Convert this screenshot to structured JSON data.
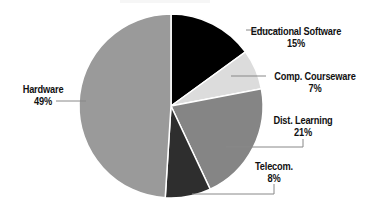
{
  "chart_data": {
    "type": "pie",
    "title": "",
    "start_angle_deg": 0,
    "direction": "clockwise",
    "center": [
      171,
      106
    ],
    "radius": 92,
    "slices": [
      {
        "label": "Educational Software",
        "value": 15,
        "display": "15%",
        "color": "#000000"
      },
      {
        "label": "Comp. Courseware",
        "value": 7,
        "display": "7%",
        "color": "#dcdcdc"
      },
      {
        "label": "Dist. Learning",
        "value": 21,
        "display": "21%",
        "color": "#858585"
      },
      {
        "label": "Telecom.",
        "value": 8,
        "display": "8%",
        "color": "#2e2e2e"
      },
      {
        "label": "Hardware",
        "value": 49,
        "display": "49%",
        "color": "#9a9a9a"
      }
    ]
  },
  "labels": [
    {
      "name": "Educational Software",
      "pct": "15%",
      "x": 296,
      "y": 25
    },
    {
      "name": "Comp. Courseware",
      "pct": "7%",
      "x": 315,
      "y": 70
    },
    {
      "name": "Dist. Learning",
      "pct": "21%",
      "x": 303,
      "y": 114
    },
    {
      "name": "Telecom.",
      "pct": "8%",
      "x": 274,
      "y": 160
    },
    {
      "name": "Hardware",
      "pct": "49%",
      "x": 43,
      "y": 83
    }
  ],
  "leaders": [
    [
      [
        246,
        30
      ],
      [
        280,
        30
      ]
    ],
    [
      [
        231,
        76
      ],
      [
        266,
        76
      ]
    ],
    [
      [
        226,
        147
      ],
      [
        303,
        147
      ],
      [
        303,
        139
      ]
    ],
    [
      [
        192,
        194
      ],
      [
        274,
        194
      ],
      [
        274,
        184
      ]
    ],
    [
      [
        56,
        101
      ],
      [
        86,
        101
      ]
    ]
  ]
}
